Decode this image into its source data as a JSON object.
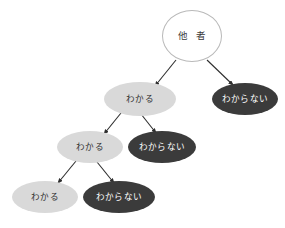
{
  "diagram": {
    "type": "binary-decision-tree",
    "background_color": "#ffffff",
    "palette": {
      "root_fill": "#ffffff",
      "root_border": "#b9b9b9",
      "light_node_fill": "#d9d9d9",
      "light_node_text": "#2e2e2e",
      "dark_node_fill": "#3b3b3b",
      "dark_node_text": "#ffffff",
      "edge_color": "#2e2e2e"
    },
    "nodes": [
      {
        "id": "root",
        "label": "他 者",
        "shape": "circle",
        "style": "root",
        "cx": 192,
        "cy": 36,
        "rx": 30,
        "ry": 26
      },
      {
        "id": "l1-wakaru",
        "label": "わかる",
        "shape": "ellipse",
        "style": "light",
        "cx": 140,
        "cy": 99,
        "rx": 36,
        "ry": 17
      },
      {
        "id": "l1-wakaranai",
        "label": "わからない",
        "shape": "ellipse",
        "style": "dark",
        "cx": 245,
        "cy": 99,
        "rx": 33,
        "ry": 16
      },
      {
        "id": "l2-wakaru",
        "label": "わかる",
        "shape": "ellipse",
        "style": "light",
        "cx": 90,
        "cy": 147,
        "rx": 33,
        "ry": 16
      },
      {
        "id": "l2-wakaranai",
        "label": "わからない",
        "shape": "ellipse",
        "style": "dark",
        "cx": 162,
        "cy": 147,
        "rx": 34,
        "ry": 16
      },
      {
        "id": "l3-wakaru",
        "label": "わかる",
        "shape": "ellipse",
        "style": "light",
        "cx": 45,
        "cy": 197,
        "rx": 33,
        "ry": 16
      },
      {
        "id": "l3-wakaranai",
        "label": "わからない",
        "shape": "ellipse",
        "style": "dark",
        "cx": 119,
        "cy": 197,
        "rx": 36,
        "ry": 16
      }
    ],
    "edges": [
      {
        "id": "edge-root-to-l1-wakaru",
        "from": "root",
        "to": "l1-wakaru",
        "x1": 176,
        "y1": 60,
        "x2": 155,
        "y2": 86
      },
      {
        "id": "edge-root-to-l1-wakaranai",
        "from": "root",
        "to": "l1-wakaranai",
        "x1": 207,
        "y1": 60,
        "x2": 233,
        "y2": 85
      },
      {
        "id": "edge-l1-to-l2-wakaru",
        "from": "l1-wakaru",
        "to": "l2-wakaru",
        "x1": 121,
        "y1": 113,
        "x2": 104,
        "y2": 134
      },
      {
        "id": "edge-l1-to-l2-wakaranai",
        "from": "l1-wakaru",
        "to": "l2-wakaranai",
        "x1": 141,
        "y1": 114,
        "x2": 156,
        "y2": 133
      },
      {
        "id": "edge-l2-to-l3-wakaru",
        "from": "l2-wakaru",
        "to": "l3-wakaru",
        "x1": 76,
        "y1": 161,
        "x2": 58,
        "y2": 183
      },
      {
        "id": "edge-l2-to-l3-wakaranai",
        "from": "l2-wakaru",
        "to": "l3-wakaranai",
        "x1": 97,
        "y1": 162,
        "x2": 114,
        "y2": 183
      }
    ]
  }
}
